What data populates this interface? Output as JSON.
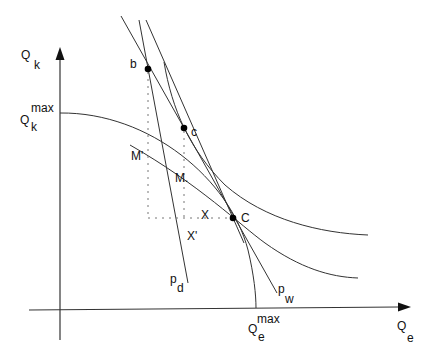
{
  "diagram": {
    "type": "trade-equilibrium-diagram",
    "axes": {
      "y": {
        "symbol": "Q",
        "subscript": "k",
        "max_label_symbol": "Q",
        "max_label_subscript": "k",
        "max_label_superscript": "max"
      },
      "x": {
        "symbol": "Q",
        "subscript": "e",
        "max_label_symbol": "Q",
        "max_label_subscript": "e",
        "max_label_superscript": "max"
      }
    },
    "points": {
      "b": "b",
      "c": "c",
      "C": "C"
    },
    "segment_labels": {
      "M_prime": "M'",
      "M": "M.",
      "X": "X",
      "X_prime": "X'"
    },
    "price_lines": {
      "pd": {
        "symbol": "p",
        "subscript": "d"
      },
      "pw": {
        "symbol": "p",
        "subscript": "w"
      }
    },
    "colors": {
      "line": "#333333",
      "point": "#000000",
      "dotted": "#777777",
      "background": "#ffffff"
    }
  }
}
